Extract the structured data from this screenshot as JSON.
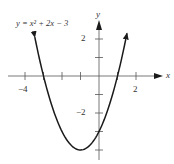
{
  "figure": {
    "equation_label": "y = x² + 2x − 3",
    "x_axis_label": "x",
    "y_axis_label": "y",
    "x_tick_labels": [
      {
        "value": -4,
        "text": "−4"
      },
      {
        "value": 2,
        "text": "2"
      }
    ],
    "y_tick_labels": [
      {
        "value": 2,
        "text": "2"
      },
      {
        "value": -2,
        "text": "−2"
      }
    ],
    "colors": {
      "curve": "#1a1a1a",
      "axes": "#555555",
      "text": "#333333"
    }
  },
  "chart_data": {
    "type": "line",
    "function": "y = x^2 + 2x - 3",
    "xlabel": "x",
    "ylabel": "y",
    "x_ticks": [
      -4,
      -3,
      -2,
      -1,
      0,
      1,
      2
    ],
    "y_ticks": [
      -4,
      -3,
      -2,
      -1,
      0,
      1,
      2
    ],
    "labeled_x_ticks": [
      -4,
      2
    ],
    "labeled_y_ticks": [
      2,
      -2
    ],
    "xlim": [
      -5.3,
      3.5
    ],
    "ylim": [
      -4.5,
      3
    ],
    "x_intercepts": [
      -3,
      1
    ],
    "y_intercept": -3,
    "vertex": [
      -1,
      -4
    ],
    "x": [
      -3.5,
      -3,
      -2.5,
      -2,
      -1.5,
      -1,
      -0.5,
      0,
      0.5,
      1,
      1.5
    ],
    "y": [
      2.25,
      0,
      -1.75,
      -3,
      -3.75,
      -4,
      -3.75,
      -3,
      -1.75,
      0,
      2.25
    ],
    "grid": false,
    "arrows_on_curve_ends": true
  }
}
